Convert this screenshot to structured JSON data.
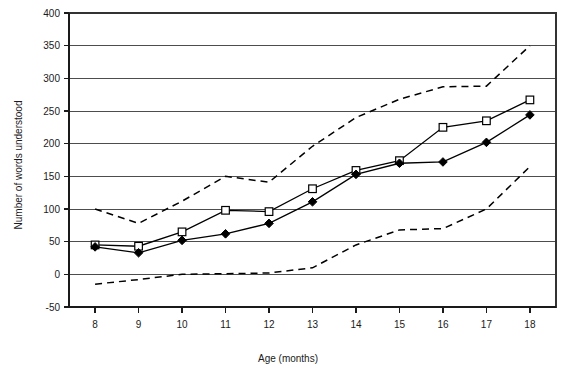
{
  "chart_data": {
    "type": "line",
    "title": "",
    "xlabel": "Age (months)",
    "ylabel": "Number of words understood",
    "x": [
      8,
      9,
      10,
      11,
      12,
      13,
      14,
      15,
      16,
      17,
      18
    ],
    "xtick_labels": [
      "8",
      "9",
      "10",
      "11",
      "12",
      "13",
      "14",
      "15",
      "16",
      "17",
      "18"
    ],
    "xlim": [
      7.4,
      18.6
    ],
    "ylim": [
      -50,
      400
    ],
    "ytick_labels": [
      "-50",
      "0",
      "50",
      "100",
      "150",
      "200",
      "250",
      "300",
      "350",
      "400"
    ],
    "yticks": [
      -50,
      0,
      50,
      100,
      150,
      200,
      250,
      300,
      350,
      400
    ],
    "grid": "horizontal",
    "legend": "none",
    "series": [
      {
        "name": "upper-percentile",
        "style": "dashed",
        "marker": "none",
        "values": [
          100,
          78,
          112,
          150,
          141,
          196,
          240,
          268,
          287,
          288,
          350
        ]
      },
      {
        "name": "median-open-square",
        "style": "solid",
        "marker": "square",
        "values": [
          45,
          43,
          65,
          98,
          96,
          131,
          159,
          174,
          225,
          235,
          267
        ]
      },
      {
        "name": "median-filled-diamond",
        "style": "solid",
        "marker": "diamond",
        "values": [
          42,
          33,
          52,
          62,
          78,
          111,
          153,
          170,
          172,
          202,
          244
        ]
      },
      {
        "name": "lower-percentile",
        "style": "dashed",
        "marker": "none",
        "values": [
          -15,
          -8,
          0,
          1,
          2,
          10,
          45,
          68,
          70,
          100,
          165
        ]
      }
    ]
  }
}
